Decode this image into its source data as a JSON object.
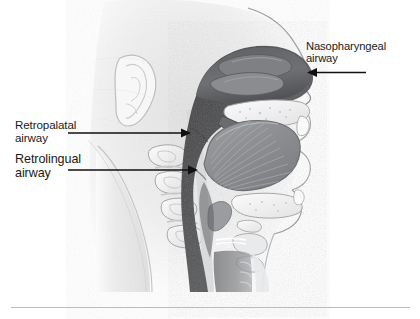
{
  "figure": {
    "type": "anatomical-illustration",
    "style": "grayscale pencil rendering",
    "colors": {
      "background": "#ffffff",
      "label_text": "#1a1a1a",
      "arrow": "#111111",
      "rule": "#b9bcc0",
      "airway_dark": "#4a4a4c",
      "soft_tissue_mid": "#8d8f92",
      "skin_light": "#f2f2f3"
    }
  },
  "labels": {
    "nasopharyngeal": {
      "text": "Nasopharyngeal\nairway",
      "line1": "Nasopharyngeal",
      "line2": "airway",
      "arrow_direction": "left"
    },
    "retropalatal": {
      "text": "Retropalatal\nairway",
      "line1": "Retropalatal",
      "line2": "airway",
      "arrow_direction": "right"
    },
    "retrolingual": {
      "text": "Retrolingual\nairway",
      "line1": "Retrolingual",
      "line2": "airway",
      "arrow_direction": "right"
    }
  },
  "anatomy": {
    "structures": [
      "ear",
      "nasal cavity",
      "nasal turbinates",
      "hard palate",
      "soft palate",
      "uvula",
      "tongue",
      "mandible",
      "cervical vertebrae",
      "epiglottis",
      "larynx",
      "trachea",
      "pharyngeal wall"
    ]
  },
  "rule": {
    "present": true
  }
}
